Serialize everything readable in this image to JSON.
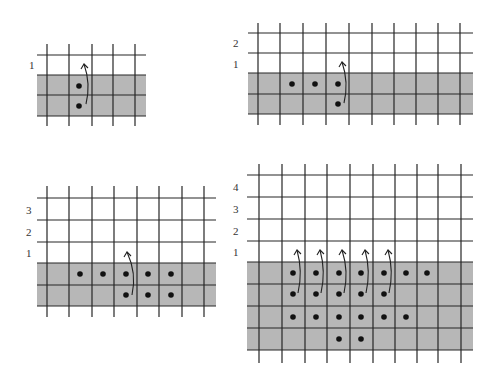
{
  "colors": {
    "band": "#b7b7b7",
    "line": "#262626",
    "dot": "#111111",
    "background": "#ffffff"
  },
  "diagrams": [
    {
      "name": "diagram-1-carry-one",
      "band": {
        "x1": 37,
        "x2": 146,
        "y1": 75,
        "y2": 116
      },
      "h_lines": {
        "x1": 37,
        "x2": 146,
        "ys": [
          55,
          75,
          95,
          116
        ]
      },
      "v_lines": {
        "y1": 44,
        "y2": 126,
        "xs": [
          47,
          69,
          92,
          113,
          135
        ]
      },
      "labels": [
        {
          "text": "1",
          "x": 29,
          "y": 69
        }
      ],
      "dots": [
        [
          79,
          86
        ],
        [
          79,
          106
        ]
      ],
      "arrows": [
        {
          "from": [
            86,
            104
          ],
          "to": [
            84,
            64
          ]
        }
      ]
    },
    {
      "name": "diagram-2-carry-two",
      "band": {
        "x1": 248,
        "x2": 473,
        "y1": 73,
        "y2": 114
      },
      "h_lines": {
        "x1": 248,
        "x2": 473,
        "ys": [
          33,
          53,
          73,
          94,
          114
        ]
      },
      "v_lines": {
        "y1": 23,
        "y2": 125,
        "xs": [
          258,
          280,
          303,
          326,
          349,
          372,
          394,
          416,
          438,
          460
        ]
      },
      "labels": [
        {
          "text": "2",
          "x": 233,
          "y": 47
        },
        {
          "text": "1",
          "x": 233,
          "y": 68
        }
      ],
      "dots": [
        [
          292,
          84
        ],
        [
          315,
          84
        ],
        [
          338,
          84
        ],
        [
          338,
          104
        ]
      ],
      "arrows": [
        {
          "from": [
            344,
            103
          ],
          "to": [
            342,
            62
          ]
        }
      ]
    },
    {
      "name": "diagram-3-carry-three",
      "band": {
        "x1": 37,
        "x2": 216,
        "y1": 263,
        "y2": 306
      },
      "h_lines": {
        "x1": 37,
        "x2": 216,
        "ys": [
          198,
          220,
          242,
          263,
          285,
          306
        ]
      },
      "v_lines": {
        "y1": 186,
        "y2": 317,
        "xs": [
          47,
          69,
          92,
          114,
          137,
          159,
          182,
          204
        ]
      },
      "labels": [
        {
          "text": "3",
          "x": 26,
          "y": 214
        },
        {
          "text": "2",
          "x": 26,
          "y": 236
        },
        {
          "text": "1",
          "x": 26,
          "y": 257
        }
      ],
      "dots": [
        [
          80,
          274
        ],
        [
          103,
          274
        ],
        [
          126,
          274
        ],
        [
          148,
          274
        ],
        [
          171,
          274
        ],
        [
          126,
          295
        ],
        [
          148,
          295
        ],
        [
          171,
          295
        ]
      ],
      "arrows": [
        {
          "from": [
            132,
            295
          ],
          "to": [
            127,
            252
          ]
        }
      ]
    },
    {
      "name": "diagram-4-carry-four",
      "band": {
        "x1": 247,
        "x2": 473,
        "y1": 262,
        "y2": 350
      },
      "h_lines": {
        "x1": 247,
        "x2": 473,
        "ys": [
          175,
          197,
          219,
          241,
          262,
          284,
          306,
          328,
          350
        ]
      },
      "v_lines": {
        "y1": 164,
        "y2": 363,
        "xs": [
          259,
          282,
          305,
          327,
          350,
          373,
          395,
          417,
          438,
          461
        ]
      },
      "labels": [
        {
          "text": "4",
          "x": 233,
          "y": 191
        },
        {
          "text": "3",
          "x": 233,
          "y": 213
        },
        {
          "text": "2",
          "x": 233,
          "y": 235
        },
        {
          "text": "1",
          "x": 233,
          "y": 256
        }
      ],
      "dots": [
        [
          293,
          273
        ],
        [
          316,
          273
        ],
        [
          339,
          273
        ],
        [
          361,
          273
        ],
        [
          384,
          273
        ],
        [
          406,
          273
        ],
        [
          427,
          273
        ],
        [
          293,
          294
        ],
        [
          316,
          294
        ],
        [
          339,
          294
        ],
        [
          361,
          294
        ],
        [
          384,
          294
        ],
        [
          293,
          317
        ],
        [
          316,
          317
        ],
        [
          339,
          317
        ],
        [
          361,
          317
        ],
        [
          384,
          317
        ],
        [
          406,
          317
        ],
        [
          339,
          339
        ],
        [
          361,
          339
        ]
      ],
      "arrows": [
        {
          "from": [
            298,
            293
          ],
          "to": [
            297,
            250
          ]
        },
        {
          "from": [
            321,
            293
          ],
          "to": [
            320,
            250
          ]
        },
        {
          "from": [
            344,
            293
          ],
          "to": [
            342,
            250
          ]
        },
        {
          "from": [
            366,
            293
          ],
          "to": [
            365,
            250
          ]
        },
        {
          "from": [
            389,
            293
          ],
          "to": [
            388,
            250
          ]
        }
      ]
    }
  ]
}
